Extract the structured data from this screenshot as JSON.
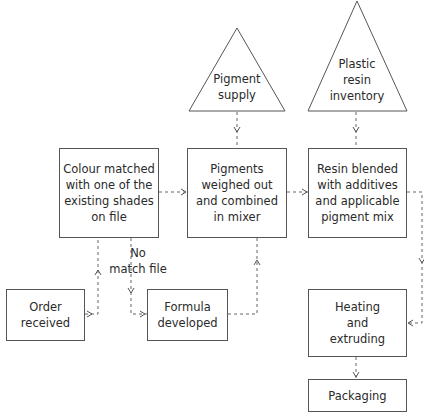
{
  "diagram": {
    "type": "process-flowchart",
    "line_color": "#555555",
    "nodes": {
      "pigment_supply": {
        "shape": "triangle",
        "text": "Pigment\nsupply"
      },
      "plastic_resin_inventory": {
        "shape": "triangle",
        "text": "Plastic\nresin\ninventory"
      },
      "colour_matched": {
        "shape": "box",
        "text": "Colour matched\nwith one of the\nexisting shades\non file"
      },
      "pigments_weighed": {
        "shape": "box",
        "text": "Pigments\nweighed out\nand combined\nin mixer"
      },
      "resin_blended": {
        "shape": "box",
        "text": "Resin blended\nwith additives\nand applicable\npigment mix"
      },
      "order_received": {
        "shape": "box",
        "text": "Order\nreceived"
      },
      "formula_developed": {
        "shape": "box",
        "text": "Formula\ndeveloped"
      },
      "heating_extruding": {
        "shape": "box",
        "text": "Heating\nand\nextruding"
      },
      "packaging": {
        "shape": "box",
        "text": "Packaging"
      }
    },
    "edge_labels": {
      "no_match": "No\nmatch file"
    },
    "edges": [
      {
        "from": "order_received",
        "to": "colour_matched",
        "style": "dashed"
      },
      {
        "from": "colour_matched",
        "to": "formula_developed",
        "style": "dashed",
        "label": "No match file"
      },
      {
        "from": "colour_matched",
        "to": "pigments_weighed",
        "style": "dashed"
      },
      {
        "from": "formula_developed",
        "to": "pigments_weighed",
        "style": "dashed"
      },
      {
        "from": "pigment_supply",
        "to": "pigments_weighed",
        "style": "dashed"
      },
      {
        "from": "pigments_weighed",
        "to": "resin_blended",
        "style": "dashed"
      },
      {
        "from": "plastic_resin_inventory",
        "to": "resin_blended",
        "style": "dashed"
      },
      {
        "from": "resin_blended",
        "to": "heating_extruding",
        "style": "dashed"
      },
      {
        "from": "heating_extruding",
        "to": "packaging",
        "style": "dashed"
      }
    ]
  }
}
